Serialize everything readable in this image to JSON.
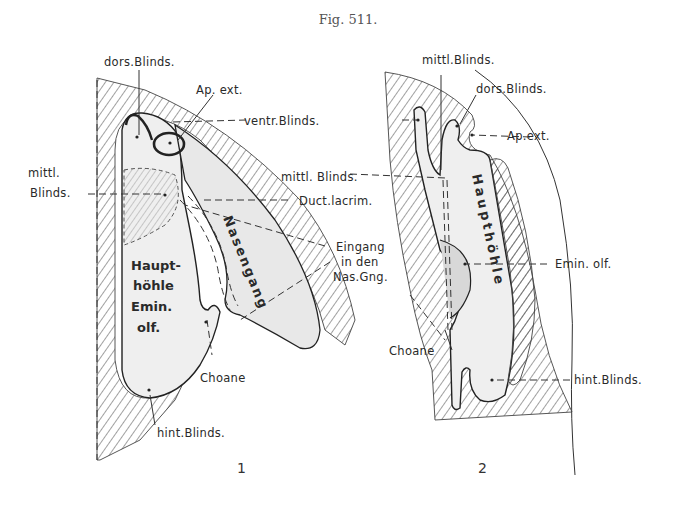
{
  "figure": {
    "title": "Fig. 511.",
    "panels": [
      {
        "number": "1",
        "labels": {
          "dors_blinds": "dors.Blinds.",
          "ap_ext": "Ap. ext.",
          "ventr_blinds": "ventr.Blinds.",
          "mittl": "mittl.",
          "blinds": "Blinds.",
          "mittl_blinds": "mittl. Blinds.",
          "duct_lacrim": "Duct.lacrim.",
          "eingang_1": "Eingang",
          "eingang_2": "in den",
          "eingang_3": "Nas.Gng.",
          "haupt_1": "Haupt-",
          "haupt_2": "höhle",
          "haupt_3": "Emin.",
          "haupt_4": "olf.",
          "nasengang": "Nasengang",
          "choane": "Choane",
          "hint_blinds": "hint.Blinds."
        }
      },
      {
        "number": "2",
        "labels": {
          "mittl_blinds": "mittl.Blinds.",
          "dors_blinds": "dors.Blinds.",
          "ap_ext": "Ap.ext.",
          "hauptsoehle": "Haupthöhle",
          "emin_olf": "Emin. olf.",
          "choane": "Choane",
          "hint_blinds": "hint.Blinds."
        }
      }
    ]
  }
}
